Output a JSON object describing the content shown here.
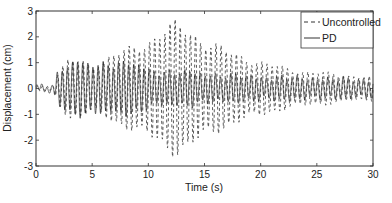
{
  "chart_data": {
    "type": "line",
    "title": "",
    "xlabel": "Time (s)",
    "ylabel": "Displacement (cm)",
    "xlim": [
      0,
      30
    ],
    "ylim": [
      -3,
      3
    ],
    "xticks": [
      0,
      5,
      10,
      15,
      20,
      25,
      30
    ],
    "yticks": [
      -3,
      -2,
      -1,
      0,
      1,
      2,
      3
    ],
    "grid": false,
    "legend_position": "upper right",
    "series": [
      {
        "name": "Uncontrolled",
        "style": "dashed",
        "color": "#333333",
        "frequency_hz": 2.2,
        "envelope": {
          "t": [
            0,
            1.5,
            2.0,
            3.0,
            5.0,
            7.0,
            8.5,
            10.0,
            11.5,
            12.5,
            13.5,
            15.0,
            17.0,
            19.0,
            21.0,
            23.0,
            25.0,
            27.0,
            30.0
          ],
          "amp": [
            0.1,
            0.1,
            0.7,
            1.3,
            1.0,
            1.5,
            1.7,
            2.1,
            2.6,
            2.7,
            2.6,
            2.1,
            1.6,
            1.3,
            1.0,
            0.8,
            0.7,
            0.6,
            0.5
          ]
        }
      },
      {
        "name": "PD",
        "style": "solid",
        "color": "#222222",
        "frequency_hz": 2.2,
        "envelope": {
          "t": [
            0,
            1.5,
            2.0,
            3.0,
            5.0,
            7.0,
            8.5,
            10.0,
            12.0,
            15.0,
            18.0,
            21.0,
            24.0,
            27.0,
            30.0
          ],
          "amp": [
            0.12,
            0.15,
            0.8,
            1.2,
            1.0,
            1.2,
            1.1,
            0.8,
            0.75,
            0.65,
            0.55,
            0.5,
            0.45,
            0.42,
            0.4
          ]
        }
      }
    ]
  },
  "legend": {
    "items": [
      {
        "label": "Uncontrolled",
        "style": "dashed"
      },
      {
        "label": "PD",
        "style": "solid"
      }
    ]
  }
}
